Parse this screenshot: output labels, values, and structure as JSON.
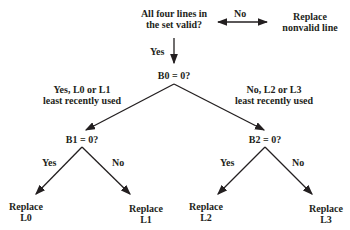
{
  "diagram": {
    "root": {
      "line1": "All four lines in",
      "line2": "the set valid?"
    },
    "root_no_label": "No",
    "root_no_result": {
      "line1": "Replace",
      "line2": "nonvalid line"
    },
    "root_yes_label": "Yes",
    "b0": "B0 = 0?",
    "b0_yes_label": {
      "line1": "Yes, L0 or L1",
      "line2": "least recently used"
    },
    "b0_no_label": {
      "line1": "No, L2 or L3",
      "line2": "least recently used"
    },
    "b1": "B1 = 0?",
    "b2": "B2 = 0?",
    "b1_yes": "Yes",
    "b1_no": "No",
    "b2_yes": "Yes",
    "b2_no": "No",
    "leaf_l0": {
      "line1": "Replace",
      "line2": "L0"
    },
    "leaf_l1": {
      "line1": "Replace",
      "line2": "L1"
    },
    "leaf_l2": {
      "line1": "Replace",
      "line2": "L2"
    },
    "leaf_l3": {
      "line1": "Replace",
      "line2": "L3"
    },
    "line_color": "#231f20"
  }
}
